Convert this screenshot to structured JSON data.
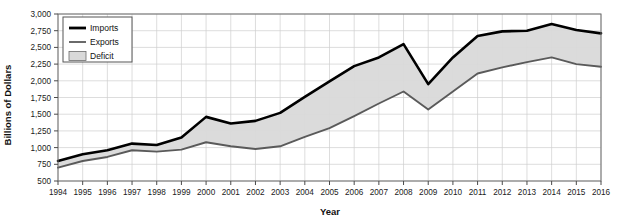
{
  "chart_data": {
    "type": "area",
    "title": "",
    "xlabel": "Year",
    "ylabel": "Billions of Dollars",
    "categories": [
      1994,
      1995,
      1996,
      1997,
      1998,
      1999,
      2000,
      2001,
      2002,
      2003,
      2004,
      2005,
      2006,
      2007,
      2008,
      2009,
      2010,
      2011,
      2012,
      2013,
      2014,
      2015,
      2016
    ],
    "x": [
      "1994",
      "1995",
      "1996",
      "1997",
      "1998",
      "1999",
      "2000",
      "2001",
      "2002",
      "2003",
      "2004",
      "2005",
      "2006",
      "2007",
      "2008",
      "2009",
      "2010",
      "2011",
      "2012",
      "2013",
      "2014",
      "2015",
      "2016"
    ],
    "series": [
      {
        "name": "Imports",
        "color": "#000000",
        "values": [
          800,
          900,
          960,
          1060,
          1040,
          1150,
          1460,
          1360,
          1400,
          1520,
          1760,
          1990,
          2220,
          2350,
          2550,
          1950,
          2350,
          2670,
          2740,
          2750,
          2850,
          2760,
          2710
        ]
      },
      {
        "name": "Exports",
        "color": "#5a5a5a",
        "values": [
          700,
          800,
          860,
          960,
          940,
          970,
          1080,
          1020,
          980,
          1020,
          1160,
          1290,
          1470,
          1660,
          1840,
          1570,
          1840,
          2110,
          2200,
          2280,
          2350,
          2250,
          2210
        ]
      }
    ],
    "fill_series": {
      "name": "Deficit",
      "color": "#d9d9d9",
      "description": "Shaded area between Imports and Exports"
    },
    "ylim": [
      500,
      3000
    ],
    "ytick_step": 250,
    "ytick_labels": [
      "500",
      "750",
      "1,000",
      "1,250",
      "1,500",
      "1,750",
      "2,000",
      "2,250",
      "2,500",
      "2,750",
      "3,000"
    ],
    "ytick_values": [
      500,
      750,
      1000,
      1250,
      1500,
      1750,
      2000,
      2250,
      2500,
      2750,
      3000
    ],
    "grid": true,
    "legend_position": "top-left",
    "legend_entries": [
      {
        "label": "Imports",
        "marker": "thick-line",
        "color": "#000000"
      },
      {
        "label": "Exports",
        "marker": "thin-line",
        "color": "#5a5a5a"
      },
      {
        "label": "Deficit",
        "marker": "filled-box",
        "color": "#d9d9d9"
      }
    ]
  }
}
